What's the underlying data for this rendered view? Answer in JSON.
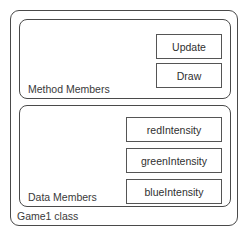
{
  "diagram": {
    "type": "uml-class-diagram",
    "class_label": "Game1 class",
    "colors": {
      "background": "#ffffff",
      "outline": "#4a4a4a",
      "member_outline": "#555555",
      "text": "#3a3a3a"
    },
    "sections": [
      {
        "id": "method-members",
        "label": "Method Members",
        "members": [
          {
            "label": "Update"
          },
          {
            "label": "Draw"
          }
        ]
      },
      {
        "id": "data-members",
        "label": "Data Members",
        "members": [
          {
            "label": "redIntensity"
          },
          {
            "label": "greenIntensity"
          },
          {
            "label": "blueIntensity"
          }
        ]
      }
    ]
  }
}
